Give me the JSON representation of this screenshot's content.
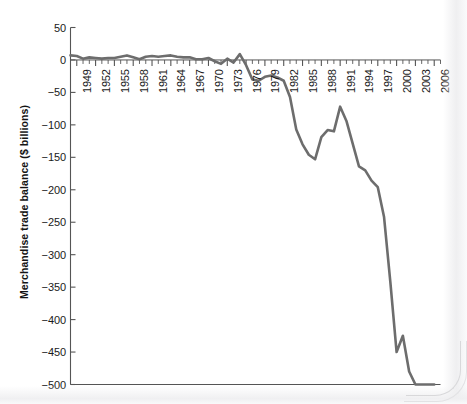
{
  "chart_data": {
    "type": "line",
    "title": "",
    "subtitle": "",
    "xlabel": "",
    "ylabel": "Merchandise trade balance ($ billions)",
    "xlim": [
      1948,
      2007
    ],
    "ylim": [
      -500,
      50
    ],
    "ytick_labels": [
      "50",
      "0",
      "−50",
      "−100",
      "−150",
      "−200",
      "−250",
      "−300",
      "−350",
      "−400",
      "−450",
      "−500"
    ],
    "ytick_values": [
      50,
      0,
      -50,
      -100,
      -150,
      -200,
      -250,
      -300,
      -350,
      -400,
      -450,
      -500
    ],
    "xtick_labels": [
      "1949",
      "1952",
      "1955",
      "1958",
      "1961",
      "1964",
      "1967",
      "1970",
      "1973",
      "1976",
      "1979",
      "1982",
      "1985",
      "1988",
      "1991",
      "1994",
      "1997",
      "2000",
      "2003",
      "2006"
    ],
    "xtick_values": [
      1949,
      1952,
      1955,
      1958,
      1961,
      1964,
      1967,
      1970,
      1973,
      1976,
      1979,
      1982,
      1985,
      1988,
      1991,
      1994,
      1997,
      2000,
      2003,
      2006
    ],
    "minor_tick_interval": 1,
    "grid": false,
    "legend": null,
    "legend_position": "none",
    "line_color": "#6d6d6d",
    "axis_color": "#555555",
    "text_color": "#1a1a1a",
    "background_color": "#ffffff",
    "x": [
      1948,
      1949,
      1950,
      1951,
      1952,
      1953,
      1954,
      1955,
      1956,
      1957,
      1958,
      1959,
      1960,
      1961,
      1962,
      1963,
      1964,
      1965,
      1966,
      1967,
      1968,
      1969,
      1970,
      1971,
      1972,
      1973,
      1974,
      1975,
      1976,
      1977,
      1978,
      1979,
      1980,
      1981,
      1982,
      1983,
      1984,
      1985,
      1986,
      1987,
      1988,
      1989,
      1990,
      1991,
      1992,
      1993,
      1994,
      1995,
      1996,
      1997,
      1998,
      1999,
      2000,
      2001,
      2002,
      2003,
      2004,
      2005,
      2006
    ],
    "series": [
      {
        "name": "Merchandise trade balance",
        "values": [
          7,
          6,
          2,
          4,
          3,
          2,
          3,
          3,
          5,
          7,
          4,
          1,
          5,
          6,
          5,
          6,
          7,
          5,
          4,
          4,
          1,
          1,
          3,
          -2,
          -6,
          2,
          -4,
          9,
          -8,
          -30,
          -32,
          -26,
          -24,
          -27,
          -32,
          -57,
          -107,
          -130,
          -146,
          -153,
          -119,
          -108,
          -110,
          -72,
          -94,
          -129,
          -164,
          -170,
          -186,
          -196,
          -242,
          -342,
          -450,
          -425,
          -480,
          -545,
          -660,
          -770,
          -830
        ]
      }
    ],
    "annotations": []
  }
}
